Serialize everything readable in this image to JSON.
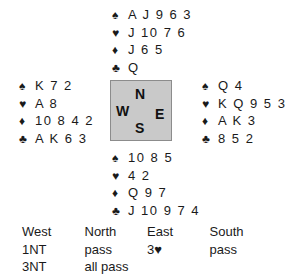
{
  "suit_symbols": {
    "spades": "♠",
    "hearts": "♥",
    "diamonds": "♦",
    "clubs": "♣"
  },
  "hands": {
    "north": {
      "spades": "A J 9 6 3",
      "hearts": "J 10 7 6",
      "diamonds": "J 6 5",
      "clubs": "Q"
    },
    "west": {
      "spades": "K 7 2",
      "hearts": "A 8",
      "diamonds": "10 8 4 2",
      "clubs": "A K 6 3"
    },
    "east": {
      "spades": "Q 4",
      "hearts": "K Q 9 5 3",
      "diamonds": "A K 3",
      "clubs": "8 5 2"
    },
    "south": {
      "spades": "10 8 5",
      "hearts": "4 2",
      "diamonds": "Q 9 7",
      "clubs": "J 10 9 7 4"
    }
  },
  "compass": {
    "north": "N",
    "south": "S",
    "east": "E",
    "west": "W"
  },
  "auction": {
    "headers": [
      "West",
      "North",
      "East",
      "South"
    ],
    "rows": [
      [
        "1NT",
        "pass",
        "3♥",
        "pass"
      ],
      [
        "3NT",
        "all pass",
        "",
        ""
      ]
    ]
  },
  "colors": {
    "compass_fill": "#c9c9c9",
    "compass_border": "#8c8c8c",
    "text": "#1a1a1a"
  }
}
